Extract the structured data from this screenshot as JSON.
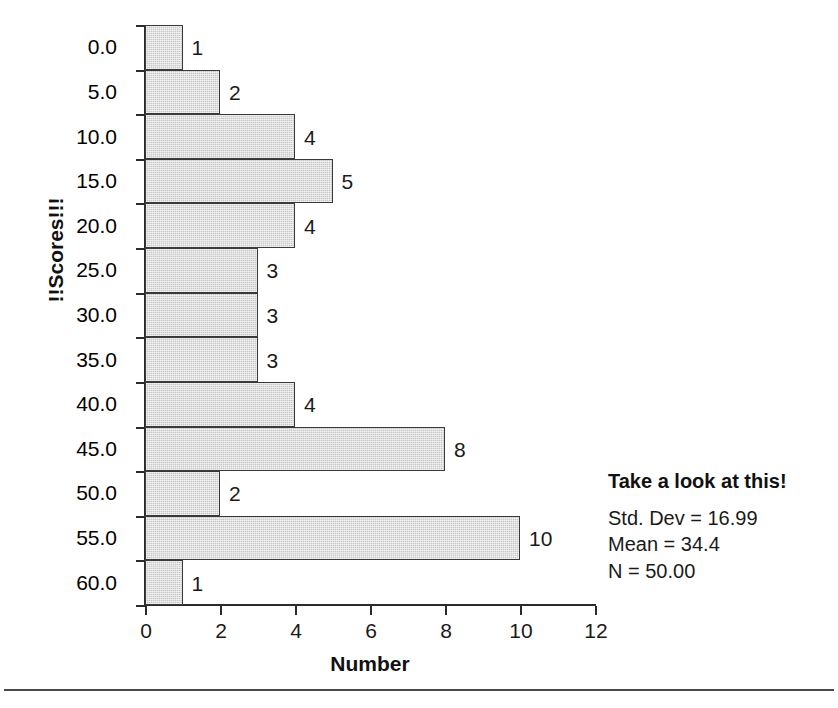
{
  "chart_data": {
    "type": "bar",
    "orientation": "horizontal",
    "title": "",
    "xlabel": "Number",
    "ylabel": "!!Scores!!!",
    "categories": [
      "0.0",
      "5.0",
      "10.0",
      "15.0",
      "20.0",
      "25.0",
      "30.0",
      "35.0",
      "40.0",
      "45.0",
      "50.0",
      "55.0",
      "60.0"
    ],
    "values": [
      1,
      2,
      4,
      5,
      4,
      3,
      3,
      3,
      4,
      8,
      2,
      10,
      1
    ],
    "value_labels": [
      "1",
      "2",
      "4",
      "5",
      "4",
      "3",
      "3",
      "3",
      "4",
      "8",
      "2",
      "10",
      "1"
    ],
    "xlim": [
      0,
      12
    ],
    "xticks": [
      0,
      2,
      4,
      6,
      8,
      10,
      12
    ],
    "xtick_labels": [
      "0",
      "2",
      "4",
      "6",
      "8",
      "10",
      "12"
    ],
    "grid": false,
    "legend": "none",
    "bar_fill": "#c8c8c8",
    "bar_edge": "#3a3a3a"
  },
  "stats": {
    "title": "Take a look at this!",
    "lines": [
      "Std. Dev = 16.99",
      "Mean = 34.4",
      "N = 50.00"
    ],
    "std_dev": "16.99",
    "mean": "34.4",
    "n": "50.00"
  }
}
